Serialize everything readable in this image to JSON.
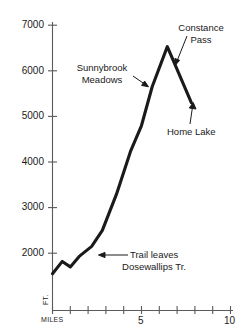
{
  "chart_data": {
    "type": "line",
    "title": "",
    "subtitle": "",
    "xlabel": "MILES",
    "ylabel": "FT.",
    "xlim": [
      0,
      10
    ],
    "ylim": [
      1200,
      7200
    ],
    "grid": false,
    "legend": "none",
    "x_ticks": [
      0,
      1,
      2,
      3,
      4,
      5,
      6,
      7,
      8,
      9,
      10
    ],
    "x_tick_labels": [
      "MILES",
      "",
      "",
      "",
      "",
      "5",
      "",
      "",
      "",
      "",
      "10"
    ],
    "y_ticks": [
      2000,
      3000,
      4000,
      5000,
      6000,
      7000
    ],
    "y_tick_labels": [
      "2000",
      "3000",
      "4000",
      "5000",
      "6000",
      "7000"
    ],
    "series": [
      {
        "name": "Trail elevation profile",
        "x": [
          0.0,
          0.55,
          1.0,
          1.5,
          2.2,
          2.8,
          3.6,
          4.4,
          5.0,
          5.6,
          6.45,
          7.8
        ],
        "y": [
          1550,
          1820,
          1700,
          1930,
          2150,
          2500,
          3300,
          4250,
          4800,
          5650,
          6530,
          5300
        ]
      }
    ],
    "annotations": [
      {
        "label": "Trail leaves\nDosewallips Tr.",
        "line1": "Trail leaves",
        "line2": "Dosewallips Tr.",
        "point_x": 2.2,
        "point_y": 2150,
        "arrow": "left"
      },
      {
        "label": "Sunnybrook\nMeadows",
        "line1": "Sunnybrook",
        "line2": "Meadows",
        "point_x": 5.0,
        "point_y": 4950,
        "arrow": "right-down"
      },
      {
        "label": "Constance\nPass",
        "line1": "Constance",
        "line2": "Pass",
        "point_x": 6.45,
        "point_y": 6530,
        "arrow": "down-left"
      },
      {
        "label": "Home Lake",
        "line1": "Home Lake",
        "line2": "",
        "point_x": 7.8,
        "point_y": 5300,
        "arrow": "up"
      }
    ],
    "colors": {
      "line": "#1a1a1a",
      "axis": "#4d4d4d",
      "text": "#1a1a1a",
      "background": "#ffffff"
    }
  }
}
